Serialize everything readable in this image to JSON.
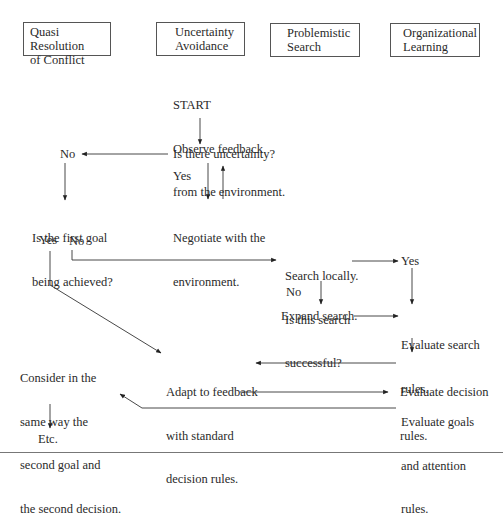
{
  "headers": [
    {
      "line1": "Quasi Resolution",
      "line2": "of Conflict"
    },
    {
      "line1": "Uncertainty",
      "line2": "Avoidance"
    },
    {
      "line1": "Problemistic",
      "line2": "Search"
    },
    {
      "line1": "Organizational",
      "line2": "Learning"
    }
  ],
  "nodes": {
    "start": {
      "line1": "START",
      "line2": "Observe feedback",
      "line3": "from the environment."
    },
    "uncertainty_q": "Is there uncertainty?",
    "no_1": "No",
    "yes_1": "Yes",
    "negotiate": {
      "line1": "Negotiate with the",
      "line2": "environment."
    },
    "first_goal_q": {
      "line1": "Is the first goal",
      "line2": "being achieved?"
    },
    "yes_2": "Yes",
    "no_2": "No",
    "search_q": {
      "line1": "Search locally.",
      "line2": "Is this search",
      "line3": "successful?"
    },
    "yes_3": "Yes",
    "no_3": "No",
    "expand": "Expand search.",
    "eval_search": {
      "line1": "Evaluate search",
      "line2": "rules."
    },
    "adapt": {
      "line1": "Adapt to feedback",
      "line2": "with standard",
      "line3": "decision rules."
    },
    "eval_decision": {
      "line1": "Evaluate decision",
      "line2": "rules."
    },
    "eval_goals": {
      "line1": "Evaluate goals",
      "line2": "and attention",
      "line3": "rules."
    },
    "consider": {
      "line1": "Consider in the",
      "line2": "same way the",
      "line3": "second goal and",
      "line4": "the second decision."
    },
    "etc": "Etc."
  }
}
